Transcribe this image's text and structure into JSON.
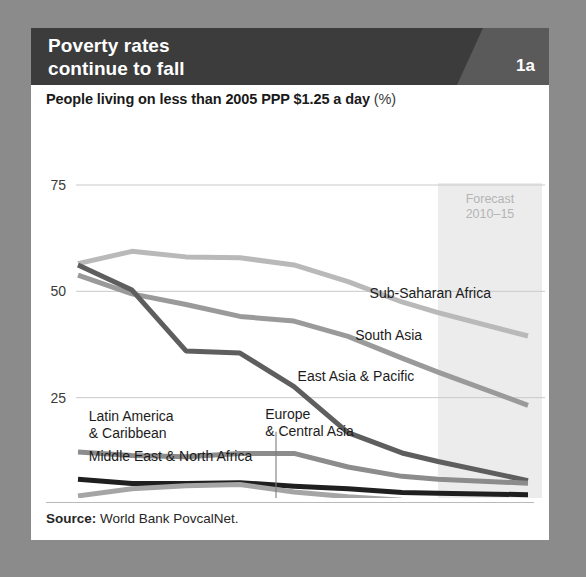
{
  "header": {
    "title": "Poverty rates\ncontinue to fall",
    "badge": "1a",
    "band_color": "#3c3c3c",
    "wedge_color": "#5a5a5a"
  },
  "subtitle": {
    "bold_part": "People living on less than 2005 PPP $1.25 a day ",
    "light_part": "(%)"
  },
  "source": {
    "label": "Source:",
    "text": " World Bank PovcalNet."
  },
  "forecast": {
    "note_line1": "Forecast",
    "note_line2": "2010–15",
    "start_year": 2010,
    "end_year": 2015,
    "band_color": "#ececec"
  },
  "chart_data": {
    "type": "line",
    "title": "Poverty rates continue to fall",
    "subtitle": "People living on less than 2005 PPP $1.25 a day (%)",
    "xlabel": "",
    "ylabel": "",
    "x": [
      1990,
      1993,
      1996,
      1999,
      2002,
      2005,
      2008,
      2010,
      2015
    ],
    "xlim": [
      1990,
      2015
    ],
    "ylim": [
      0,
      75
    ],
    "yticks": [
      0,
      25,
      50,
      75
    ],
    "xticks": [
      1990,
      1995,
      2000,
      2005,
      2010,
      2015
    ],
    "xtick_labels": [
      "1990",
      "1995",
      "2000",
      "2005",
      "2010",
      "2015"
    ],
    "xtick_sublabels": [
      "",
      "",
      "",
      "",
      "estimate",
      "forecast"
    ],
    "grid": "horizontal",
    "legend": "inline-labels",
    "series": [
      {
        "name": "Sub-Saharan Africa",
        "color": "#b9b9b9",
        "label_x": 2006.2,
        "label_y": 48.5,
        "values": [
          56.5,
          59.4,
          58.1,
          57.9,
          56.2,
          52.3,
          47.5,
          45.0,
          39.5
        ]
      },
      {
        "name": "South Asia",
        "color": "#9a9a9a",
        "label_x": 2005.4,
        "label_y": 38.5,
        "values": [
          53.8,
          49.4,
          46.9,
          44.1,
          43.0,
          39.4,
          34.3,
          31.0,
          23.2
        ]
      },
      {
        "name": "East Asia & Pacific",
        "color": "#5e5e5e",
        "label_x": 2002.2,
        "label_y": 29.0,
        "values": [
          56.2,
          50.3,
          36.0,
          35.5,
          27.6,
          16.8,
          12.0,
          10.0,
          5.5
        ]
      },
      {
        "name": "Latin America & Caribbean",
        "color": "#8c8c8c",
        "label_x": 1990.6,
        "label_y": 19.5,
        "label_line2_offset": 2.6,
        "values": [
          12.2,
          11.4,
          11.1,
          11.9,
          11.9,
          8.7,
          6.5,
          5.8,
          4.9
        ]
      },
      {
        "name": "Middle East & North Africa",
        "color": "#1f1f1f",
        "label_x": 1990.6,
        "label_y": 10.2,
        "values": [
          5.8,
          4.8,
          4.8,
          5.0,
          4.2,
          3.6,
          2.7,
          2.5,
          2.2
        ]
      },
      {
        "name": "Europe & Central Asia",
        "color": "#a5a5a5",
        "label_x": 2000.4,
        "label_y": 20.0,
        "label_line2_offset": 2.6,
        "leader_x": 2001.0,
        "leader_y_top": 17.0,
        "leader_y_bottom": 1.4,
        "values": [
          1.9,
          3.6,
          4.3,
          4.6,
          2.8,
          1.7,
          0.9,
          0.8,
          0.6
        ]
      }
    ]
  }
}
